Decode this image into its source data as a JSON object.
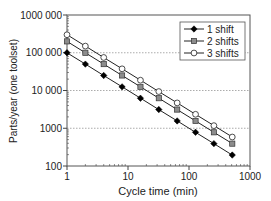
{
  "chart_data": {
    "type": "line",
    "title": "",
    "xlabel": "Cycle time (min)",
    "ylabel": "Parts/year (one toolset)",
    "xscale": "log",
    "yscale": "log",
    "xlim": [
      1,
      1000
    ],
    "ylim": [
      100,
      1000000
    ],
    "x_ticks": [
      1,
      10,
      100,
      1000
    ],
    "x_tick_labels": [
      "1",
      "10",
      "100",
      "1000"
    ],
    "y_ticks": [
      100,
      1000,
      10000,
      100000,
      1000000
    ],
    "y_tick_labels": [
      "100",
      "1000",
      "10 000",
      "100 000",
      "1000 000"
    ],
    "grid": "horizontal dotted at major y ticks",
    "legend_position": "upper right",
    "x": [
      1,
      2,
      4,
      8,
      16,
      32,
      64,
      128,
      256,
      512
    ],
    "series": [
      {
        "name": "1 shift",
        "marker": "diamond-filled",
        "values": [
          100000,
          50000,
          25000,
          12500,
          6250,
          3125,
          1563,
          781,
          391,
          195
        ]
      },
      {
        "name": "2 shifts",
        "marker": "square-gray",
        "values": [
          200000,
          100000,
          50000,
          25000,
          12500,
          6250,
          3125,
          1563,
          781,
          391
        ]
      },
      {
        "name": "3 shifts",
        "marker": "circle-open",
        "values": [
          300000,
          150000,
          75000,
          37500,
          18750,
          9375,
          4688,
          2344,
          1172,
          586
        ]
      }
    ]
  },
  "legend": {
    "items": [
      "1 shift",
      "2 shifts",
      "3 shifts"
    ]
  },
  "axes": {
    "xlabel": "Cycle time (min)",
    "ylabel": "Parts/year (one toolset)"
  },
  "colors": {
    "line": "#222222",
    "marker_1": "#000000",
    "marker_2": "#8c8c8c",
    "marker_3": "#ffffff",
    "grid": "#888888"
  }
}
